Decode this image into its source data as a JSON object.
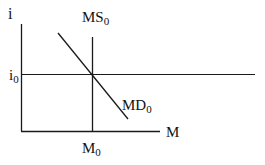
{
  "diagram": {
    "y_axis_label": "i",
    "x_axis_label": "M",
    "equilibrium_rate_label": {
      "base": "i",
      "sub": "0"
    },
    "equilibrium_quantity_label": {
      "base": "M",
      "sub": "0"
    },
    "money_supply_label": {
      "base": "MS",
      "sub": "0"
    },
    "money_demand_label": {
      "base": "MD",
      "sub": "0"
    },
    "line_color": "#1a1a1a"
  }
}
